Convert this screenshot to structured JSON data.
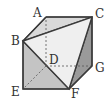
{
  "figure": {
    "type": "cube-with-triangular-section",
    "vertices": {
      "A": {
        "label": "A"
      },
      "B": {
        "label": "B"
      },
      "C": {
        "label": "C"
      },
      "D": {
        "label": "D"
      },
      "E": {
        "label": "E"
      },
      "F": {
        "label": "F"
      },
      "G": {
        "label": "G"
      }
    },
    "colors": {
      "edge": "#3a3a3a",
      "hidden_edge": "#555555",
      "top_face": "#d9d9d9",
      "section_face": "#efefef",
      "front_face": "#c4c4c4",
      "right_face": "#9a9a9a",
      "background": "#ffffff"
    }
  }
}
